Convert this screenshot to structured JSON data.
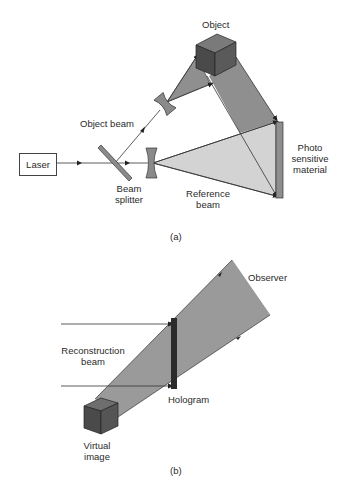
{
  "figure_a": {
    "caption": "(a)",
    "labels": {
      "laser": "Laser",
      "object": "Object",
      "object_beam": "Object beam",
      "beam_splitter_line1": "Beam",
      "beam_splitter_line2": "splitter",
      "reference_beam_line1": "Reference",
      "reference_beam_line2": "beam",
      "photo_line1": "Photo",
      "photo_line2": "sensitive",
      "photo_line3": "material"
    }
  },
  "figure_b": {
    "caption": "(b)",
    "labels": {
      "observer": "Observer",
      "reconstruction_line1": "Reconstruction",
      "reconstruction_line2": "beam",
      "hologram": "Hologram",
      "virtual_line1": "Virtual",
      "virtual_line2": "image"
    }
  },
  "colors": {
    "beam_dark": "#8c8c8c",
    "beam_light": "#cfcfcf",
    "cube_front": "#4a4a4a",
    "cube_top": "#777777",
    "cube_side": "#5e5e5e",
    "hologram": "#2b2b2b",
    "plate": "#8e8e8e",
    "line": "#333333"
  }
}
